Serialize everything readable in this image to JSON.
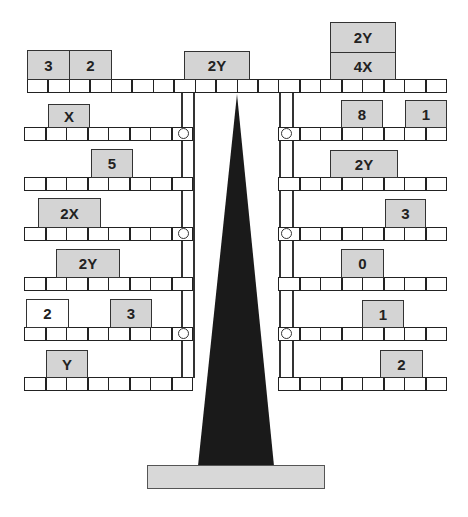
{
  "diagram": {
    "colors": {
      "block_fill": "#d4d4d4",
      "block_white_fill": "#ffffff",
      "fulcrum": "#1a1a1a",
      "base_fill": "#d8d8d8",
      "line": "#222222"
    },
    "main_beam": {
      "cells": 20,
      "blocks": [
        {
          "label": "3",
          "left": 27,
          "top": 50,
          "width": 42,
          "height": 29
        },
        {
          "label": "2",
          "left": 69,
          "top": 50,
          "width": 42,
          "height": 29
        },
        {
          "label": "2Y",
          "left": 184,
          "top": 51,
          "width": 65,
          "height": 28
        },
        {
          "label": "4X",
          "left": 330,
          "top": 52,
          "width": 66,
          "height": 27
        },
        {
          "label": "2Y",
          "left": 330,
          "top": 22,
          "width": 66,
          "height": 30
        }
      ]
    },
    "left_arm": {
      "rows": [
        {
          "index": 1,
          "has_peg": true,
          "blocks": [
            {
              "label": "X",
              "left": 48,
              "width": 41,
              "white": false
            }
          ]
        },
        {
          "index": 2,
          "has_peg": false,
          "blocks": [
            {
              "label": "5",
              "left": 91,
              "width": 42,
              "white": false
            }
          ]
        },
        {
          "index": 3,
          "has_peg": true,
          "blocks": [
            {
              "label": "2X",
              "left": 38,
              "width": 63,
              "white": false
            }
          ]
        },
        {
          "index": 4,
          "has_peg": false,
          "blocks": [
            {
              "label": "2Y",
              "left": 56,
              "width": 64,
              "white": false
            }
          ]
        },
        {
          "index": 5,
          "has_peg": true,
          "blocks": [
            {
              "label": "2",
              "left": 26,
              "width": 43,
              "white": true
            },
            {
              "label": "3",
              "left": 110,
              "width": 42,
              "white": false
            }
          ]
        },
        {
          "index": 6,
          "has_peg": false,
          "blocks": [
            {
              "label": "Y",
              "left": 46,
              "width": 42,
              "white": false
            }
          ]
        }
      ]
    },
    "right_arm": {
      "rows": [
        {
          "index": 1,
          "has_peg": true,
          "blocks": [
            {
              "label": "8",
              "left": 341,
              "width": 42,
              "white": false
            },
            {
              "label": "1",
              "left": 405,
              "width": 42,
              "white": false
            }
          ]
        },
        {
          "index": 2,
          "has_peg": false,
          "blocks": [
            {
              "label": "2Y",
              "left": 330,
              "width": 68,
              "white": false
            }
          ]
        },
        {
          "index": 3,
          "has_peg": true,
          "blocks": [
            {
              "label": "3",
              "left": 385,
              "width": 41,
              "white": false
            }
          ]
        },
        {
          "index": 4,
          "has_peg": false,
          "blocks": [
            {
              "label": "0",
              "left": 341,
              "width": 43,
              "white": false
            }
          ]
        },
        {
          "index": 5,
          "has_peg": true,
          "blocks": [
            {
              "label": "1",
              "left": 362,
              "width": 42,
              "white": false
            }
          ]
        },
        {
          "index": 6,
          "has_peg": false,
          "blocks": [
            {
              "label": "2",
              "left": 380,
              "width": 43,
              "white": false
            }
          ]
        }
      ]
    },
    "labels": {
      "main_3": "3",
      "main_2": "2",
      "main_2y": "2Y",
      "main_4x": "4X",
      "main_2y_top": "2Y",
      "l1": "X",
      "l2": "5",
      "l3": "2X",
      "l4": "2Y",
      "l5a": "2",
      "l5b": "3",
      "l6": "Y",
      "r1a": "8",
      "r1b": "1",
      "r2": "2Y",
      "r3": "3",
      "r4": "0",
      "r5": "1",
      "r6": "2"
    }
  }
}
